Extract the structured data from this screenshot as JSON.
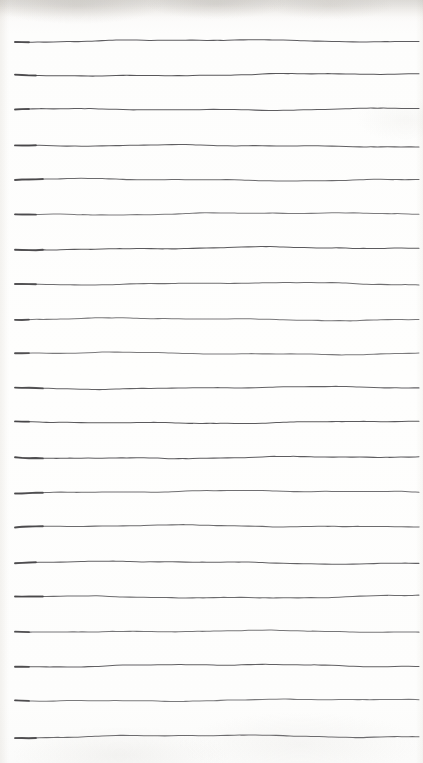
{
  "document": {
    "kind": "scanned-ruled-paper",
    "title": "Ruled notebook page",
    "description": "Blank scanned sheet of paper with hand-drawn horizontal ruling lines and no written text",
    "width": 423,
    "height": 763,
    "paper_color": "#fdfdfc",
    "ink_color": "#58575a",
    "text_content": "",
    "annotations": []
  },
  "ruling": {
    "line_count": 21,
    "first_line_y": 41,
    "last_line_y": 737,
    "spacing": 34.8,
    "left_x": 15,
    "right_x": 419,
    "stroke_width": 1.05,
    "style": "hand-drawn",
    "lines": [
      {
        "index": 1,
        "y": 41
      },
      {
        "index": 2,
        "y": 75
      },
      {
        "index": 3,
        "y": 110
      },
      {
        "index": 4,
        "y": 145
      },
      {
        "index": 5,
        "y": 180
      },
      {
        "index": 6,
        "y": 214
      },
      {
        "index": 7,
        "y": 249
      },
      {
        "index": 8,
        "y": 284
      },
      {
        "index": 9,
        "y": 319
      },
      {
        "index": 10,
        "y": 353
      },
      {
        "index": 11,
        "y": 388
      },
      {
        "index": 12,
        "y": 423
      },
      {
        "index": 13,
        "y": 458
      },
      {
        "index": 14,
        "y": 492
      },
      {
        "index": 15,
        "y": 527
      },
      {
        "index": 16,
        "y": 562
      },
      {
        "index": 17,
        "y": 597
      },
      {
        "index": 18,
        "y": 631
      },
      {
        "index": 19,
        "y": 666
      },
      {
        "index": 20,
        "y": 701
      },
      {
        "index": 21,
        "y": 737
      }
    ]
  }
}
